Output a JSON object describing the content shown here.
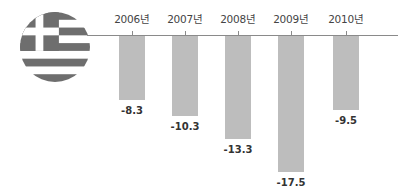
{
  "chart_data": {
    "type": "bar",
    "title": "",
    "xlabel": "",
    "ylabel": "",
    "categories": [
      "2006년",
      "2007년",
      "2008년",
      "2009년",
      "2010년"
    ],
    "values": [
      -8.3,
      -10.3,
      -13.3,
      -17.5,
      -9.5
    ],
    "value_labels": [
      "-8.3",
      "-10.3",
      "-13.3",
      "-17.5",
      "-9.5"
    ],
    "ylim": [
      -18,
      0
    ],
    "grid": false,
    "legend": null,
    "bar_color": "#bdbdbd",
    "axis_position": "top",
    "annotations": [
      "Greek flag icon (grayscale)"
    ]
  },
  "flag": {
    "country": "Greece",
    "icon": "greece-flag-icon",
    "color": "#6e6e6e"
  }
}
